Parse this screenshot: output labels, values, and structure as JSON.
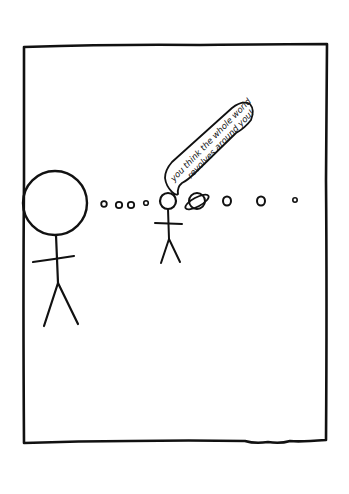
{
  "comic": {
    "panel_count": 1,
    "background_color": "#ffffff",
    "ink_color": "#111111",
    "speech_bubble": {
      "speaker": "small-stick-figure",
      "lines": [
        "you think the whole world",
        "revolves around you!"
      ]
    },
    "characters": [
      {
        "name": "big-stick-figure",
        "description": "stick figure with a large round head"
      },
      {
        "name": "small-stick-figure",
        "description": "stick figure with a small round head"
      }
    ],
    "planets": [
      {
        "name": "planet-1",
        "ringed": false
      },
      {
        "name": "planet-2",
        "ringed": false
      },
      {
        "name": "planet-3",
        "ringed": false
      },
      {
        "name": "planet-4",
        "ringed": false
      },
      {
        "name": "planet-saturn",
        "ringed": true
      },
      {
        "name": "planet-5",
        "ringed": false
      },
      {
        "name": "planet-6",
        "ringed": false
      },
      {
        "name": "planet-7",
        "ringed": false
      }
    ]
  }
}
